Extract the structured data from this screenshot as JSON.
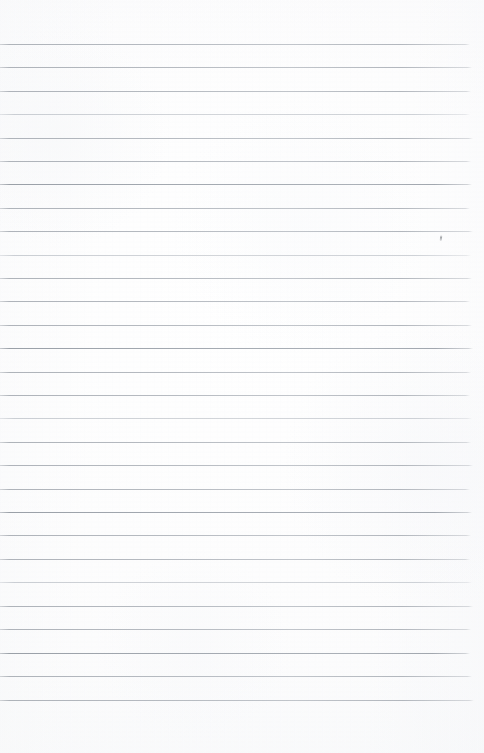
{
  "document": {
    "kind": "scanned-lined-notebook-page",
    "title": "Blank ruled paper scan",
    "page_width_px": 484,
    "page_height_px": 753,
    "content_text": "",
    "is_blank": true
  },
  "paper": {
    "background_color": "#fefefe",
    "tone_color": "#f7f8fa",
    "edge_color": "#ffffff"
  },
  "rules": {
    "line_color": "#aeb3ba",
    "line_color_soft": "#c0c4ca",
    "line_color_strong": "#9aa0a8",
    "first_line_y": 44,
    "line_spacing_px": 23.4,
    "line_count": 29,
    "line_left_px": 0,
    "line_right_px": 472,
    "line_thickness_px": 1,
    "lines": [
      {
        "y": 44,
        "weight": "normal",
        "right": 470
      },
      {
        "y": 67,
        "weight": "normal",
        "right": 472
      },
      {
        "y": 91,
        "weight": "normal",
        "right": 471
      },
      {
        "y": 114,
        "weight": "soft",
        "right": 470
      },
      {
        "y": 138,
        "weight": "normal",
        "right": 473
      },
      {
        "y": 161,
        "weight": "normal",
        "right": 471
      },
      {
        "y": 184,
        "weight": "strong",
        "right": 472
      },
      {
        "y": 208,
        "weight": "normal",
        "right": 470
      },
      {
        "y": 231,
        "weight": "normal",
        "right": 473
      },
      {
        "y": 255,
        "weight": "soft",
        "right": 471
      },
      {
        "y": 278,
        "weight": "normal",
        "right": 472
      },
      {
        "y": 301,
        "weight": "normal",
        "right": 470
      },
      {
        "y": 325,
        "weight": "normal",
        "right": 472
      },
      {
        "y": 348,
        "weight": "strong",
        "right": 473
      },
      {
        "y": 372,
        "weight": "normal",
        "right": 471
      },
      {
        "y": 395,
        "weight": "normal",
        "right": 470
      },
      {
        "y": 418,
        "weight": "soft",
        "right": 472
      },
      {
        "y": 442,
        "weight": "normal",
        "right": 471
      },
      {
        "y": 465,
        "weight": "normal",
        "right": 473
      },
      {
        "y": 489,
        "weight": "normal",
        "right": 470
      },
      {
        "y": 512,
        "weight": "strong",
        "right": 472
      },
      {
        "y": 535,
        "weight": "normal",
        "right": 471
      },
      {
        "y": 559,
        "weight": "normal",
        "right": 470
      },
      {
        "y": 582,
        "weight": "soft",
        "right": 472
      },
      {
        "y": 606,
        "weight": "normal",
        "right": 473
      },
      {
        "y": 629,
        "weight": "normal",
        "right": 471
      },
      {
        "y": 653,
        "weight": "strong",
        "right": 470
      },
      {
        "y": 676,
        "weight": "normal",
        "right": 472
      },
      {
        "y": 700,
        "weight": "normal",
        "right": 474
      }
    ]
  },
  "marks": [
    {
      "name": "pencil-dot",
      "x": 440,
      "y": 235,
      "description": "faint pencil mark"
    }
  ]
}
